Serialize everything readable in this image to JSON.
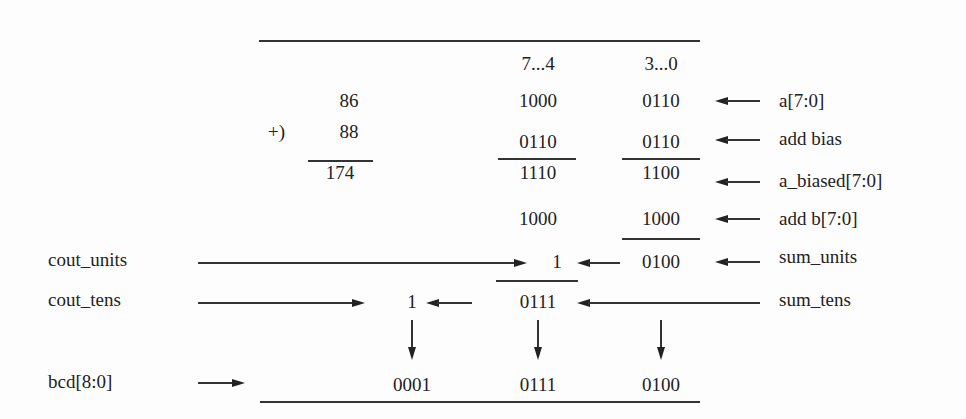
{
  "headers": {
    "high_nibble": "7...4",
    "low_nibble": "3...0"
  },
  "decimal": {
    "a": "86",
    "plus": "+)",
    "b": "88",
    "sum": "174"
  },
  "rows": {
    "a": {
      "high": "1000",
      "low": "0110",
      "label": "a[7:0]"
    },
    "bias": {
      "high": "0110",
      "low": "0110",
      "label": "add bias"
    },
    "biased": {
      "high": "1110",
      "low": "1100",
      "label": "a_biased[7:0]"
    },
    "b": {
      "high": "1000",
      "low": "1000",
      "label": "add b[7:0]"
    },
    "units": {
      "carry": "1",
      "low": "0100",
      "label": "sum_units",
      "left_label": "cout_units"
    },
    "tens": {
      "carry": "1",
      "high": "0111",
      "label": "sum_tens",
      "left_label": "cout_tens"
    },
    "bcd": {
      "hundreds": "0001",
      "tens": "0111",
      "units": "0100",
      "left_label": "bcd[8:0]"
    }
  }
}
